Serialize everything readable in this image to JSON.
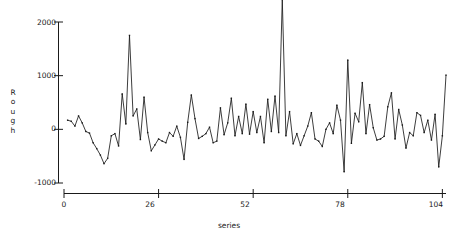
{
  "chart_data": {
    "type": "line",
    "title": "",
    "xlabel": "series",
    "ylabel": "Rough",
    "ylabel_letters": [
      "R",
      "o",
      "u",
      "g",
      "h"
    ],
    "xlim": [
      0,
      105
    ],
    "ylim": [
      -1000,
      2450
    ],
    "xticks": [
      0,
      26,
      52,
      78,
      104
    ],
    "xtick_labels": [
      "0",
      "26",
      "52",
      "78",
      "104"
    ],
    "yticks": [
      -1000,
      0,
      1000,
      2000
    ],
    "ytick_labels": [
      "-1000",
      "0",
      "1000",
      "2000"
    ],
    "grid": false,
    "legend": null,
    "line_color": "#1a1a1a",
    "marker": "point",
    "series": [
      {
        "name": "Rough",
        "x": [
          1,
          2,
          3,
          4,
          5,
          6,
          7,
          8,
          9,
          10,
          11,
          12,
          13,
          14,
          15,
          16,
          17,
          18,
          19,
          20,
          21,
          22,
          23,
          24,
          25,
          26,
          27,
          28,
          29,
          30,
          31,
          32,
          33,
          34,
          35,
          36,
          37,
          38,
          39,
          40,
          41,
          42,
          43,
          44,
          45,
          46,
          47,
          48,
          49,
          50,
          51,
          52,
          53,
          54,
          55,
          56,
          57,
          58,
          59,
          60,
          61,
          62,
          63,
          64,
          65,
          66,
          67,
          68,
          69,
          70,
          71,
          72,
          73,
          74,
          75,
          76,
          77,
          78,
          79,
          80,
          81,
          82,
          83,
          84,
          85,
          86,
          87,
          88,
          89,
          90,
          91,
          92,
          93,
          94,
          95,
          96,
          97,
          98,
          99,
          100,
          101,
          102,
          103,
          104,
          105
        ],
        "values": [
          170,
          150,
          60,
          250,
          120,
          -40,
          -70,
          -250,
          -360,
          -480,
          -640,
          -540,
          -120,
          -80,
          -310,
          660,
          100,
          1750,
          250,
          380,
          -190,
          600,
          -60,
          -400,
          -290,
          -180,
          -220,
          -250,
          -60,
          -130,
          60,
          -150,
          -560,
          130,
          640,
          200,
          -170,
          -130,
          -80,
          40,
          -250,
          -220,
          400,
          -100,
          120,
          580,
          -120,
          240,
          -80,
          470,
          -90,
          330,
          -60,
          240,
          -250,
          560,
          -40,
          620,
          -60,
          2420,
          -120,
          330,
          -270,
          -80,
          -300,
          -120,
          60,
          310,
          -180,
          -220,
          -320,
          0,
          120,
          -80,
          450,
          170,
          -790,
          1290,
          -260,
          300,
          140,
          870,
          -80,
          460,
          30,
          -200,
          -180,
          -130,
          420,
          680,
          -180,
          370,
          80,
          -350,
          -60,
          -120,
          310,
          260,
          -60,
          170,
          -200,
          280,
          -700,
          -120,
          1010
        ]
      }
    ]
  },
  "axes": {
    "y_axis_name": "y-axis",
    "x_axis_name": "x-axis"
  }
}
